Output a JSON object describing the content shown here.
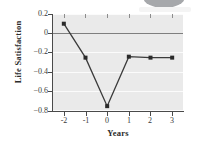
{
  "chart_data": {
    "type": "line",
    "title": "",
    "subtitle": "",
    "xlabel": "Years",
    "ylabel": "Life Satisfaction",
    "x": [
      -2,
      -1,
      0,
      1,
      2,
      3
    ],
    "xtick_labels": [
      "-2",
      "-1",
      "0",
      "1",
      "2",
      "3"
    ],
    "values": [
      0.1,
      -0.25,
      -0.75,
      -0.24,
      -0.25,
      -0.25
    ],
    "series": [
      {
        "name": "Life Satisfaction",
        "values": [
          0.1,
          -0.25,
          -0.75,
          -0.24,
          -0.25,
          -0.25
        ]
      }
    ],
    "ylim": [
      -0.8,
      0.2
    ],
    "xlim": [
      -2.5,
      3.5
    ],
    "yticks": [
      0.2,
      0,
      -0.2,
      -0.4,
      -0.6,
      -0.8
    ],
    "ytick_labels": [
      "0.2",
      "0",
      "−0.2",
      "−0.4",
      "−0.6",
      "−0.8"
    ],
    "grid": true,
    "grid_axis": "y",
    "legend": false,
    "legend_position": "none",
    "marker": "square",
    "line_color": "#3b3b3b",
    "marker_color": "#2a2a2a",
    "plot_background": "#eaeaea",
    "grid_color": "#fbfbfb",
    "zero_line_color": "#7f7f7f",
    "axis_color": "#4a4a4a",
    "annotations": []
  },
  "decor": {
    "blob_name": "partial-rounded-shape",
    "blob_color": "#a6a8ab"
  }
}
